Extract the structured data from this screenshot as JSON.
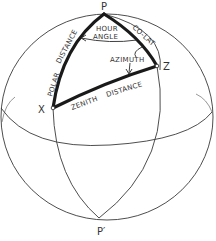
{
  "diagram": {
    "points": {
      "pole": "P",
      "south_pole": "P′",
      "zenith": "Z",
      "star": "X"
    },
    "arc_labels": {
      "hour_angle_line1": "HOUR",
      "hour_angle_line2": "ANGLE",
      "colat": "CO-LAT",
      "azimuth": "AZIMUTH",
      "polar_distance_1": "POLAR",
      "polar_distance_2": "DISTANCE",
      "zenith_distance_1": "ZENITH",
      "zenith_distance_2": "DISTANCE"
    },
    "colors": {
      "line": "#3a3a3a",
      "triangle": "#1a1a1a",
      "background": "#ffffff"
    }
  }
}
